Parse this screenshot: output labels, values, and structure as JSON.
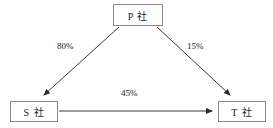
{
  "diagram": {
    "background_color": "#ffffff",
    "line_color": "#3a3a3a",
    "box_border_color": "#8a8a8a",
    "text_color": "#1a1a1a",
    "nodes": [
      {
        "id": "p",
        "label": "P 社",
        "position": "top-center"
      },
      {
        "id": "s",
        "label": "S 社",
        "position": "bottom-left"
      },
      {
        "id": "t",
        "label": "T 社",
        "position": "bottom-right"
      }
    ],
    "edges": [
      {
        "id": "p-s",
        "from": "P 社",
        "to": "S 社",
        "label": "80%",
        "arrow": "single"
      },
      {
        "id": "p-t",
        "from": "P 社",
        "to": "T 社",
        "label": "15%",
        "arrow": "single"
      },
      {
        "id": "s-t",
        "from": "S 社",
        "to": "T 社",
        "label": "45%",
        "arrow": "single"
      }
    ]
  }
}
